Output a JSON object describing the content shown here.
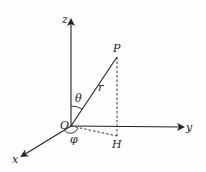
{
  "diagram": {
    "labels": {
      "z_axis": "z",
      "y_axis": "y",
      "x_axis": "x",
      "origin": "O",
      "point": "P",
      "projection": "H",
      "radius": "r",
      "polar_angle": "θ",
      "azimuth_angle": "φ"
    },
    "colors": {
      "line": "#222222",
      "background": "#fdfdfd"
    }
  }
}
